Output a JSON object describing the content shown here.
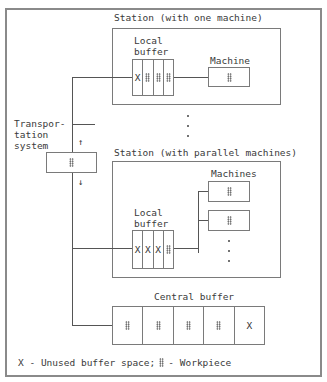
{
  "diagram": {
    "transport": {
      "label": "Transpor-\ntation\nsystem",
      "up_arrow": "↑",
      "down_arrow": "↓"
    },
    "station_one": {
      "title": "Station (with one machine)",
      "local_buffer_label": "Local\nbuffer",
      "local_buffer_cells": [
        "X",
        "wp",
        "wp",
        "wp"
      ],
      "machine_label": "Machine"
    },
    "station_parallel": {
      "title": "Station (with parallel machines)",
      "local_buffer_label": "Local\nbuffer",
      "local_buffer_cells": [
        "X",
        "X",
        "X",
        "wp"
      ],
      "machines_label": "Machines"
    },
    "central_buffer": {
      "label": "Central buffer",
      "cells": [
        "wp",
        "wp",
        "wp",
        "wp",
        "X"
      ]
    },
    "legend": {
      "x_text": "X - Unused buffer space;",
      "wp_text": "- Workpiece"
    }
  }
}
